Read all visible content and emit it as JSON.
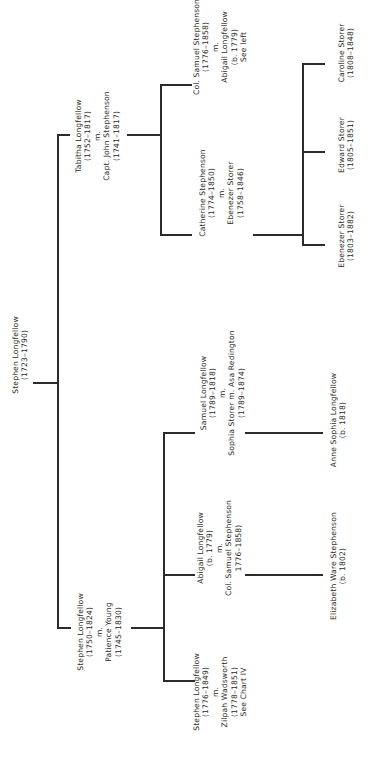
{
  "diagram": {
    "type": "family-tree",
    "orientation": "rotated-90-ccw"
  },
  "root": {
    "name": "Stephen Longfellow",
    "dates": "(1723–1790)"
  },
  "gen2": [
    {
      "name": "Tabitha Longfellow",
      "dates": "(1752–1817)",
      "marriage": "m.",
      "spouse": "Capt. John Stephenson",
      "spouse_dates": "(1741–1817)"
    },
    {
      "name": "Stephen Longfellow",
      "dates": "(1750–1824)",
      "marriage": "m.",
      "spouse": "Patience Young",
      "spouse_dates": "(1745–1830)"
    }
  ],
  "gen3_tabitha": [
    {
      "name": "Col. Samuel Stephenson",
      "dates": "(1776–1858)",
      "marriage": "m.",
      "spouse": "Abigail Longfellow",
      "spouse_dates": "(b. 1779)",
      "note": "See left"
    },
    {
      "name": "Catherine Stephenson",
      "dates": "(1774–1850)",
      "marriage": "m.",
      "spouse": "Ebenezer Storer",
      "spouse_dates": "(1758–1846)"
    }
  ],
  "gen3_stephen": [
    {
      "name": "Samuel Longfellow",
      "dates": "(1789–1818)",
      "marriage": "m.",
      "spouse": "Sophia Storer m. Asa Redington",
      "spouse_dates": "(1789–1874)"
    },
    {
      "name": "Abigail Longfellow",
      "dates": "(b. 1779)",
      "marriage": "m.",
      "spouse": "Col. Samuel Stephenson",
      "spouse_dates": "1776–1858)"
    },
    {
      "name": "Stephen Longfellow",
      "dates": "(1776–1849)",
      "marriage": "m.",
      "spouse": "Zilpah Wadsworth",
      "spouse_dates": "(1778–1851)",
      "note": "See Chart IV"
    }
  ],
  "gen4_storer": [
    {
      "name": "Caroline Storer",
      "dates": "(1808–1848)"
    },
    {
      "name": "Edward Storer",
      "dates": "(1805–1851)"
    },
    {
      "name": "Ebenezer Storer",
      "dates": "(1803–1882)"
    }
  ],
  "gen4_other": [
    {
      "name": "Anne Sophia Longfellow",
      "dates": "(b. 1818)"
    },
    {
      "name": "Elizabeth Ware Stephenson",
      "dates": "(b. 1802)"
    }
  ]
}
